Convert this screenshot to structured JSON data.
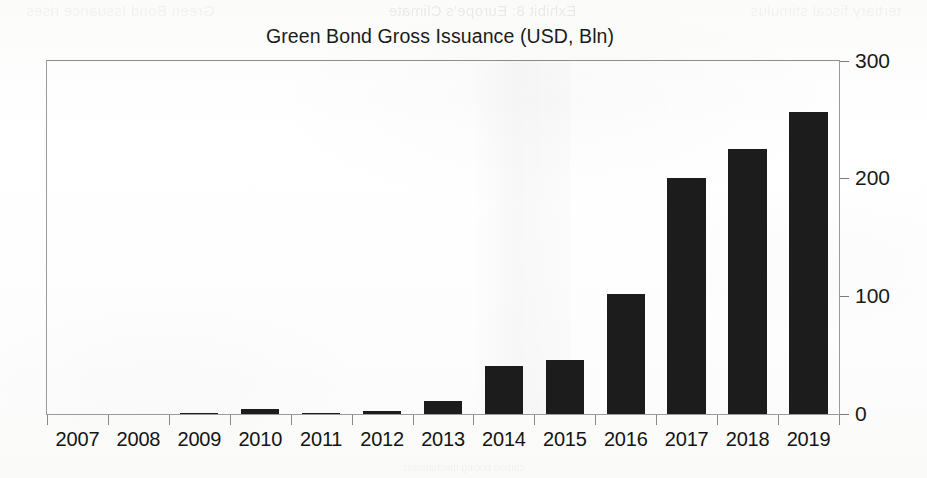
{
  "chart_data": {
    "type": "bar",
    "title": "Green Bond Gross Issuance (USD, Bln)",
    "subtitle": "",
    "xlabel": "",
    "ylabel": "",
    "categories": [
      "2007",
      "2008",
      "2009",
      "2010",
      "2011",
      "2012",
      "2013",
      "2014",
      "2015",
      "2016",
      "2017",
      "2018",
      "2019"
    ],
    "values": [
      0,
      0,
      1,
      4,
      1,
      3,
      11,
      41,
      46,
      102,
      201,
      225,
      257
    ],
    "series": [
      {
        "name": "Green Bond Gross Issuance",
        "values": [
          0,
          0,
          1,
          4,
          1,
          3,
          11,
          41,
          46,
          102,
          201,
          225,
          257
        ]
      }
    ],
    "ylim": [
      0,
      300
    ],
    "yticks": [
      0,
      100,
      200,
      300
    ],
    "ytick_labels": [
      "0",
      "100",
      "200",
      "300"
    ],
    "y_axis_position": "right",
    "grid": false,
    "legend": false,
    "legend_position": "none",
    "bar_color": "#1c1c1c",
    "frame_color": "#9a9a9a",
    "units": "USD, Bln"
  },
  "ghost_text": {
    "top_left": "tertiary fiscal stimulus",
    "top_mid": "Exhibit 8: Europe's Climate",
    "top_right": "Green Bond Issuance rises",
    "bottom": "carbon pricing mechanisms"
  }
}
